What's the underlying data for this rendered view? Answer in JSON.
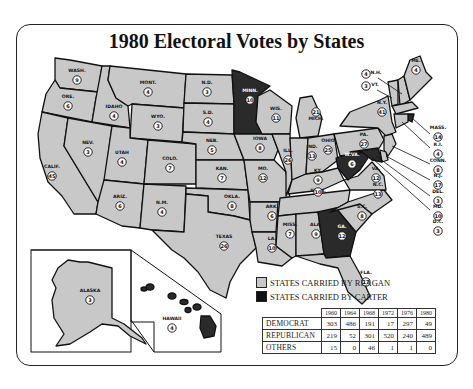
{
  "title": "1980 Electoral Votes by States",
  "colors": {
    "reagan": "#c8c8c8",
    "carter": "#2a2a2a",
    "border": "#111111"
  },
  "states": [
    {
      "abbr": "WASH.",
      "votes": "9",
      "winner": "reagan"
    },
    {
      "abbr": "ORE.",
      "votes": "6",
      "winner": "reagan"
    },
    {
      "abbr": "CALIF.",
      "votes": "45",
      "winner": "reagan"
    },
    {
      "abbr": "IDAHO",
      "votes": "4",
      "winner": "reagan"
    },
    {
      "abbr": "NEV.",
      "votes": "3",
      "winner": "reagan"
    },
    {
      "abbr": "MONT.",
      "votes": "4",
      "winner": "reagan"
    },
    {
      "abbr": "WYO.",
      "votes": "3",
      "winner": "reagan"
    },
    {
      "abbr": "UTAH",
      "votes": "4",
      "winner": "reagan"
    },
    {
      "abbr": "ARIZ.",
      "votes": "6",
      "winner": "reagan"
    },
    {
      "abbr": "COLO.",
      "votes": "7",
      "winner": "reagan"
    },
    {
      "abbr": "N.M.",
      "votes": "4",
      "winner": "reagan"
    },
    {
      "abbr": "N.D.",
      "votes": "3",
      "winner": "reagan"
    },
    {
      "abbr": "S.D.",
      "votes": "4",
      "winner": "reagan"
    },
    {
      "abbr": "NEB.",
      "votes": "5",
      "winner": "reagan"
    },
    {
      "abbr": "KAN.",
      "votes": "7",
      "winner": "reagan"
    },
    {
      "abbr": "OKLA.",
      "votes": "8",
      "winner": "reagan"
    },
    {
      "abbr": "TEXAS",
      "votes": "26",
      "winner": "reagan"
    },
    {
      "abbr": "MINN.",
      "votes": "10",
      "winner": "carter"
    },
    {
      "abbr": "IOWA",
      "votes": "8",
      "winner": "reagan"
    },
    {
      "abbr": "MO.",
      "votes": "12",
      "winner": "reagan"
    },
    {
      "abbr": "ARK.",
      "votes": "6",
      "winner": "reagan"
    },
    {
      "abbr": "LA.",
      "votes": "10",
      "winner": "reagan"
    },
    {
      "abbr": "WIS.",
      "votes": "11",
      "winner": "reagan"
    },
    {
      "abbr": "ILL.",
      "votes": "26",
      "winner": "reagan"
    },
    {
      "abbr": "MICH.",
      "votes": "21",
      "winner": "reagan"
    },
    {
      "abbr": "IND.",
      "votes": "13",
      "winner": "reagan"
    },
    {
      "abbr": "OHIO",
      "votes": "25",
      "winner": "reagan"
    },
    {
      "abbr": "KY.",
      "votes": "9",
      "winner": "reagan"
    },
    {
      "abbr": "TENN.",
      "votes": "10",
      "winner": "reagan"
    },
    {
      "abbr": "MISS.",
      "votes": "7",
      "winner": "reagan"
    },
    {
      "abbr": "ALA.",
      "votes": "9",
      "winner": "reagan"
    },
    {
      "abbr": "GA.",
      "votes": "12",
      "winner": "carter"
    },
    {
      "abbr": "FLA.",
      "votes": "17",
      "winner": "reagan"
    },
    {
      "abbr": "S.C.",
      "votes": "8",
      "winner": "reagan"
    },
    {
      "abbr": "N.C.",
      "votes": "13",
      "winner": "reagan"
    },
    {
      "abbr": "VA.",
      "votes": "12",
      "winner": "reagan"
    },
    {
      "abbr": "W.VA.",
      "votes": "6",
      "winner": "carter"
    },
    {
      "abbr": "PA.",
      "votes": "27",
      "winner": "reagan"
    },
    {
      "abbr": "N.Y.",
      "votes": "41",
      "winner": "reagan"
    },
    {
      "abbr": "VT.",
      "votes": "3",
      "winner": "reagan"
    },
    {
      "abbr": "N.H.",
      "votes": "4",
      "winner": "reagan"
    },
    {
      "abbr": "ME.",
      "votes": "4",
      "winner": "reagan"
    },
    {
      "abbr": "MASS.",
      "votes": "14",
      "winner": "reagan"
    },
    {
      "abbr": "R.I.",
      "votes": "4",
      "winner": "carter"
    },
    {
      "abbr": "CONN.",
      "votes": "8",
      "winner": "reagan"
    },
    {
      "abbr": "N.J.",
      "votes": "17",
      "winner": "reagan"
    },
    {
      "abbr": "DEL.",
      "votes": "3",
      "winner": "reagan"
    },
    {
      "abbr": "MD.",
      "votes": "10",
      "winner": "carter"
    },
    {
      "abbr": "D.C.",
      "votes": "3",
      "winner": "carter"
    },
    {
      "abbr": "ALASKA",
      "votes": "3",
      "winner": "reagan"
    },
    {
      "abbr": "HAWAII",
      "votes": "4",
      "winner": "carter"
    }
  ],
  "legend": {
    "reagan": "STATES CARRIED BY REAGAN",
    "carter": "STATES CARRIED BY CARTER"
  },
  "results_table": {
    "years": [
      "1960",
      "1964",
      "1968",
      "1972",
      "1976",
      "1980"
    ],
    "rows": [
      {
        "party": "DEMOCRAT",
        "values": [
          "303",
          "486",
          "191",
          "17",
          "297",
          "49"
        ]
      },
      {
        "party": "REPUBLICAN",
        "values": [
          "219",
          "52",
          "301",
          "520",
          "240",
          "489"
        ]
      },
      {
        "party": "OTHERS",
        "values": [
          "15",
          "0",
          "46",
          "1",
          "1",
          "0"
        ]
      }
    ]
  }
}
